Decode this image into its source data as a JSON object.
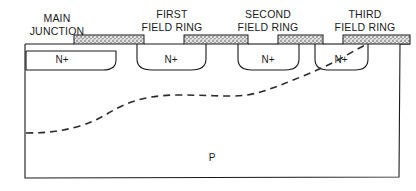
{
  "figure": {
    "kind": "semiconductor-cross-section",
    "background_color": "#ffffff",
    "line_color": "#1a1a1a",
    "oxide_fill_color": "#d8d8d8",
    "substrate_label": "P",
    "callouts": [
      {
        "id": "main-junction",
        "line1": "MAIN",
        "line2": "JUNCTION"
      },
      {
        "id": "first-field-ring",
        "line1": "FIRST",
        "line2": "FIELD RING"
      },
      {
        "id": "second-field-ring",
        "line1": "SECOND",
        "line2": "FIELD RING"
      },
      {
        "id": "third-field-ring",
        "line1": "THIRD",
        "line2": "FIELD RING"
      }
    ],
    "wells": [
      {
        "id": "main-junction-well",
        "label": "N+"
      },
      {
        "id": "first-ring-well",
        "label": "N+"
      },
      {
        "id": "second-ring-well",
        "label": "N+"
      },
      {
        "id": "third-ring-well",
        "label": "N+"
      }
    ],
    "oxide_blocks": [
      {
        "id": "oxide-block-1"
      },
      {
        "id": "oxide-block-2"
      },
      {
        "id": "oxide-block-3"
      },
      {
        "id": "oxide-block-4"
      }
    ],
    "depletion_boundary": {
      "id": "depletion-boundary",
      "style": "dashed"
    }
  }
}
